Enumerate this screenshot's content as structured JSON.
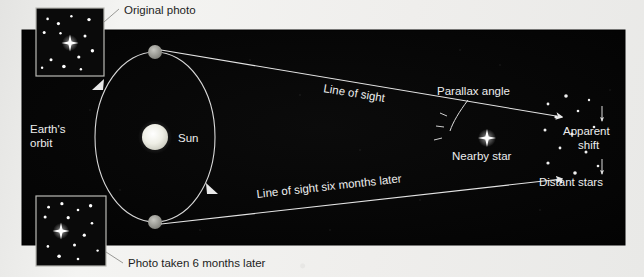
{
  "figure": {
    "type": "diagram",
    "background_color": "#efefed",
    "panel_color": "#050505",
    "ink_color": "#e8e8e8",
    "panel": {
      "x": 22,
      "y": 30,
      "width": 603,
      "height": 215
    }
  },
  "labels": {
    "original_photo": "Original photo",
    "photo_six_months": "Photo taken 6 months later",
    "earths_orbit_line1": "Earth's",
    "earths_orbit_line2": "orbit",
    "sun": "Sun",
    "line_of_sight": "Line of sight",
    "line_of_sight_later": "Line of sight six months later",
    "parallax_angle": "Parallax angle",
    "nearby_star": "Nearby star",
    "apparent_shift_line1": "Apparent",
    "apparent_shift_line2": "shift",
    "distant_stars": "Distant stars"
  },
  "scene": {
    "sun": {
      "cx": 155,
      "cy": 137,
      "r": 13
    },
    "orbit": {
      "cx": 155,
      "cy": 137,
      "rx": 60,
      "ry": 85
    },
    "earth_positions": [
      {
        "name": "earth-top",
        "cx": 155,
        "cy": 52,
        "r": 7
      },
      {
        "name": "earth-bottom",
        "cx": 155,
        "cy": 222,
        "r": 7
      }
    ],
    "nearby_star": {
      "cx": 487,
      "cy": 138
    },
    "sight_lines": [
      {
        "name": "line-of-sight",
        "x1": 162,
        "y1": 53,
        "x2": 560,
        "y2": 118
      },
      {
        "name": "line-of-sight-six-months-later",
        "x1": 162,
        "y1": 221,
        "x2": 560,
        "y2": 178
      }
    ],
    "orbit_arrows": [
      {
        "name": "orbit-arrow-upper-left",
        "x": 99,
        "y": 86
      },
      {
        "name": "orbit-arrow-lower-right",
        "x": 211,
        "y": 190
      }
    ],
    "insets": [
      {
        "name": "inset-original-photo",
        "x": 36,
        "y": 8,
        "width": 68,
        "height": 68,
        "bright_star": {
          "x": 0.5,
          "y": 0.52,
          "size": 9
        },
        "faint_stars": [
          {
            "x": 0.17,
            "y": 0.16,
            "r": 1.3
          },
          {
            "x": 0.33,
            "y": 0.23,
            "r": 1.6
          },
          {
            "x": 0.52,
            "y": 0.12,
            "r": 1.2
          },
          {
            "x": 0.78,
            "y": 0.17,
            "r": 1.7
          },
          {
            "x": 0.12,
            "y": 0.36,
            "r": 1.5
          },
          {
            "x": 0.36,
            "y": 0.37,
            "r": 1.2
          },
          {
            "x": 0.72,
            "y": 0.41,
            "r": 1.5
          },
          {
            "x": 0.83,
            "y": 0.63,
            "r": 1.7
          },
          {
            "x": 0.63,
            "y": 0.72,
            "r": 1.6
          },
          {
            "x": 0.22,
            "y": 0.76,
            "r": 1.5
          },
          {
            "x": 0.41,
            "y": 0.86,
            "r": 1.8
          },
          {
            "x": 0.66,
            "y": 0.9,
            "r": 1.2
          },
          {
            "x": 0.09,
            "y": 0.88,
            "r": 1.2
          }
        ]
      },
      {
        "name": "inset-photo-six-months-later",
        "x": 36,
        "y": 196,
        "width": 70,
        "height": 70,
        "bright_star": {
          "x": 0.36,
          "y": 0.5,
          "size": 9
        },
        "faint_stars": [
          {
            "x": 0.18,
            "y": 0.16,
            "r": 1.4
          },
          {
            "x": 0.37,
            "y": 0.11,
            "r": 1.6
          },
          {
            "x": 0.6,
            "y": 0.2,
            "r": 1.3
          },
          {
            "x": 0.78,
            "y": 0.14,
            "r": 1.7
          },
          {
            "x": 0.13,
            "y": 0.3,
            "r": 1.5
          },
          {
            "x": 0.46,
            "y": 0.31,
            "r": 1.6
          },
          {
            "x": 0.8,
            "y": 0.39,
            "r": 1.3
          },
          {
            "x": 0.69,
            "y": 0.56,
            "r": 1.6
          },
          {
            "x": 0.55,
            "y": 0.7,
            "r": 1.5
          },
          {
            "x": 0.17,
            "y": 0.72,
            "r": 1.3
          },
          {
            "x": 0.33,
            "y": 0.86,
            "r": 1.8
          },
          {
            "x": 0.6,
            "y": 0.9,
            "r": 1.3
          },
          {
            "x": 0.88,
            "y": 0.78,
            "r": 1.2
          }
        ]
      }
    ],
    "distant_star_field": [
      {
        "x": 548,
        "y": 104,
        "r": 1.4
      },
      {
        "x": 566,
        "y": 96,
        "r": 1.7
      },
      {
        "x": 578,
        "y": 111,
        "r": 1.3
      },
      {
        "x": 556,
        "y": 117,
        "r": 1.6
      },
      {
        "x": 589,
        "y": 100,
        "r": 1.2
      },
      {
        "x": 545,
        "y": 130,
        "r": 1.5
      },
      {
        "x": 572,
        "y": 134,
        "r": 1.6
      },
      {
        "x": 594,
        "y": 127,
        "r": 1.3
      },
      {
        "x": 560,
        "y": 148,
        "r": 1.4
      },
      {
        "x": 586,
        "y": 152,
        "r": 1.5
      },
      {
        "x": 548,
        "y": 163,
        "r": 1.6
      },
      {
        "x": 575,
        "y": 173,
        "r": 1.7
      },
      {
        "x": 598,
        "y": 166,
        "r": 1.3
      },
      {
        "x": 561,
        "y": 182,
        "r": 1.4
      }
    ],
    "shift_arrows": [
      {
        "name": "apparent-shift-arrow-upper",
        "x": 602,
        "y1": 107,
        "y2": 122
      },
      {
        "name": "apparent-shift-arrow-lower",
        "x": 602,
        "y1": 160,
        "y2": 175
      }
    ],
    "parallax_tick_marks": [
      {
        "x": 443,
        "y": 117
      },
      {
        "x": 440,
        "y": 128
      },
      {
        "x": 438,
        "y": 140
      }
    ],
    "leaders": [
      {
        "name": "leader-original-photo",
        "x1": 104,
        "y1": 22,
        "x2": 118,
        "y2": 9
      },
      {
        "name": "leader-photo-six-months",
        "x1": 106,
        "y1": 252,
        "x2": 122,
        "y2": 262
      },
      {
        "name": "leader-parallax-angle",
        "x1": 468,
        "y1": 99,
        "x2": 452,
        "y2": 128
      }
    ]
  }
}
